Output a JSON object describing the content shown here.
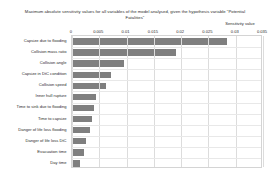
{
  "chart_data": {
    "type": "bar",
    "orientation": "horizontal",
    "title": "Maximum absolute sensitivity  values for all variables of the model analysed, given the  hypothesis variable \"Potential Fatalities\"",
    "xlabel": "Sensitivity value",
    "ylabel": "",
    "xlim": [
      0,
      0.035
    ],
    "xticks": [
      "0",
      "0.005",
      "0.01",
      "0.015",
      "0.02",
      "0.025",
      "0.03",
      "0.035"
    ],
    "xtick_values": [
      0,
      0.005,
      0.01,
      0.015,
      0.02,
      0.025,
      0.03,
      0.035
    ],
    "grid": true,
    "legend": false,
    "bar_color": "#7f7f7f",
    "categories": [
      "Capsize due to flooding",
      "Collision mass ratio",
      "Collision angle",
      "Capsize in DtC condition",
      "Collision speed",
      "Inner hull rupture",
      "Time to sink due to flooding",
      "Time to capsize",
      "Danger of life loss flooding",
      "Danger of life loss DtC",
      "Evacuation time",
      "Day time"
    ],
    "values": [
      0.0284,
      0.0191,
      0.0095,
      0.0072,
      0.0062,
      0.0044,
      0.004,
      0.0037,
      0.0033,
      0.0026,
      0.0022,
      0.0015
    ]
  }
}
